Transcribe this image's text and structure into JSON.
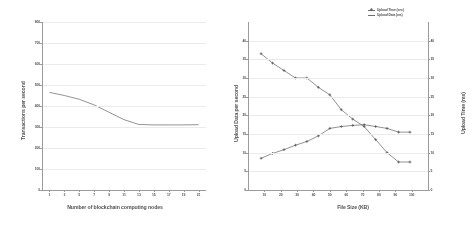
{
  "figure": {
    "background": "#ffffff",
    "line_color": "#6b6b6b",
    "axis_color": "#9a9a9a",
    "grid_color": "#ededf2",
    "text_color": "#4c4c4c"
  },
  "chart_data": [
    {
      "type": "line",
      "id": "left",
      "title": "",
      "xlabel": "Number of blockchain computing nodes",
      "ylabel": "Transactions per second",
      "xlim": [
        0,
        22
      ],
      "ylim": [
        0,
        800
      ],
      "grid": true,
      "legend_position": "none",
      "xticklabels": [
        "1",
        "3",
        "5",
        "7",
        "9",
        "11",
        "13",
        "15",
        "17",
        "19",
        "21"
      ],
      "xtickvalues": [
        1,
        3,
        5,
        7,
        9,
        11,
        13,
        15,
        17,
        19,
        21
      ],
      "yticklabels": [
        "0",
        "100",
        "200",
        "300",
        "400",
        "500",
        "600",
        "700",
        "800"
      ],
      "ytickvalues": [
        0,
        100,
        200,
        300,
        400,
        500,
        600,
        700,
        800
      ],
      "x": [
        1,
        3,
        5,
        7,
        9,
        11,
        13,
        15,
        17,
        19,
        21
      ],
      "values": [
        465,
        450,
        432,
        405,
        370,
        335,
        312,
        310,
        310,
        310,
        311
      ],
      "series": [
        {
          "name": "Transactions per second",
          "values": [
            465,
            450,
            432,
            405,
            370,
            335,
            312,
            310,
            310,
            310,
            311
          ],
          "markers": false
        }
      ]
    },
    {
      "type": "line",
      "id": "right",
      "title": "",
      "xlabel": "File Size (KB)",
      "ylabel": "Upload Data per second",
      "ylabel_right": "Upload Time (ms)",
      "xlim": [
        0,
        110
      ],
      "ylim": [
        0,
        45
      ],
      "ylim_right": [
        0,
        45
      ],
      "grid": true,
      "legend_position": "top-right",
      "xticklabels": [
        "10",
        "20",
        "30",
        "40",
        "50",
        "60",
        "70",
        "80",
        "90",
        "100"
      ],
      "xtickvalues": [
        10,
        20,
        30,
        40,
        50,
        60,
        70,
        80,
        90,
        100
      ],
      "yticklabels": [
        "0",
        "5",
        "10",
        "15",
        "20",
        "25",
        "30",
        "35",
        "40"
      ],
      "ytickvalues": [
        0,
        5,
        10,
        15,
        20,
        25,
        30,
        35,
        40
      ],
      "yticklabels_right": [
        "0",
        "5",
        "10",
        "15",
        "20",
        "25",
        "30",
        "35",
        "40"
      ],
      "x": [
        8,
        15,
        22,
        29,
        36,
        43,
        50,
        57,
        64,
        71,
        78,
        85,
        92,
        99
      ],
      "series": [
        {
          "name": "Upload Time (sec)",
          "axis": "right",
          "markers": true,
          "values": [
            36.5,
            34.0,
            32.0,
            30.0,
            30.0,
            27.5,
            25.5,
            21.5,
            19.0,
            17.0,
            13.5,
            10.0,
            7.5,
            7.5
          ]
        },
        {
          "name": "Upload Data (ms)",
          "axis": "left",
          "markers": true,
          "values": [
            8.5,
            9.8,
            10.8,
            12.0,
            13.0,
            14.5,
            16.5,
            17.0,
            17.3,
            17.5,
            17.0,
            16.5,
            15.5,
            15.5
          ]
        }
      ],
      "legend": [
        {
          "label": "Upload Time (sec)",
          "marker": "plus"
        },
        {
          "label": "Upload Data  (ms)",
          "marker": "line"
        }
      ]
    }
  ]
}
